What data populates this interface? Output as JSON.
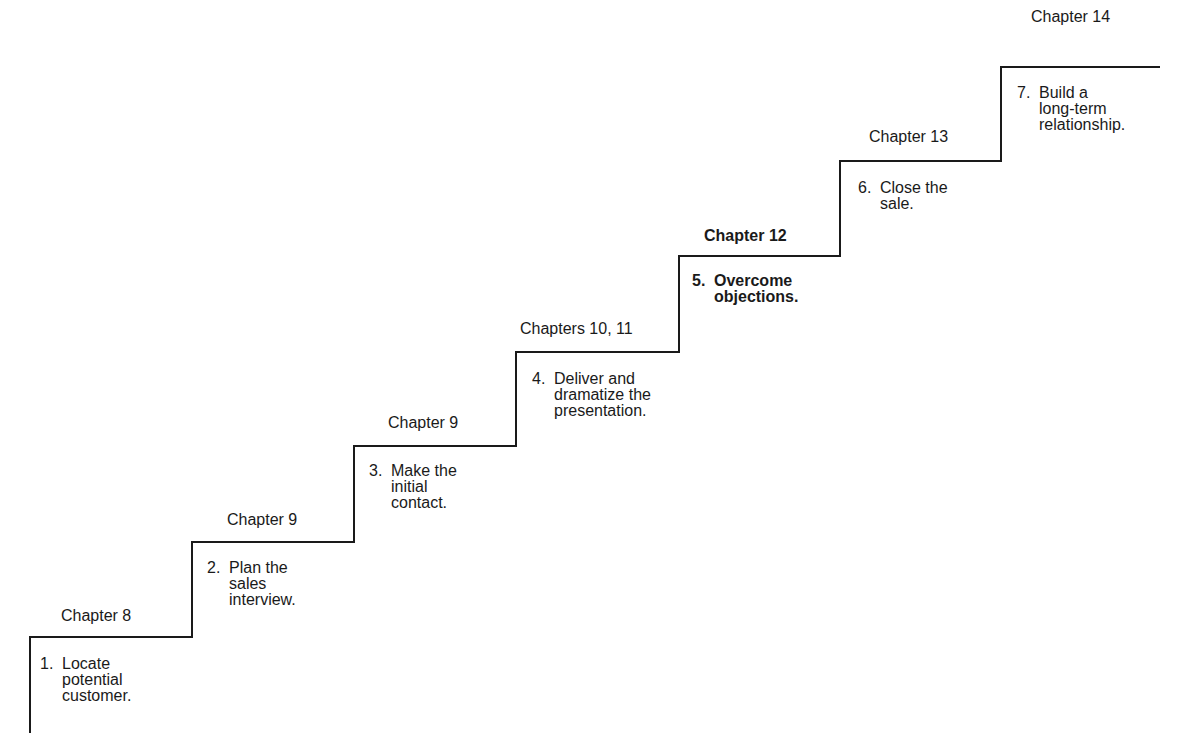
{
  "diagram": {
    "type": "staircase",
    "line_color": "#1a1a1a",
    "steps": [
      {
        "number": "1.",
        "text": "Locate\npotential\ncustomer.",
        "chapter": "Chapter 8",
        "bold": false
      },
      {
        "number": "2.",
        "text": "Plan the\nsales\ninterview.",
        "chapter": "Chapter 9",
        "bold": false
      },
      {
        "number": "3.",
        "text": "Make the\ninitial\ncontact.",
        "chapter": "Chapter 9",
        "bold": false
      },
      {
        "number": "4.",
        "text": "Deliver and\ndramatize the\npresentation.",
        "chapter": "Chapters 10, 11",
        "bold": false
      },
      {
        "number": "5.",
        "text": "Overcome\nobjections.",
        "chapter": "Chapter 12",
        "bold": true
      },
      {
        "number": "6.",
        "text": "Close the\nsale.",
        "chapter": "Chapter 13",
        "bold": false
      },
      {
        "number": "7.",
        "text": "Build a\nlong-term\nrelationship.",
        "chapter": "Chapter 14",
        "bold": false
      }
    ]
  }
}
